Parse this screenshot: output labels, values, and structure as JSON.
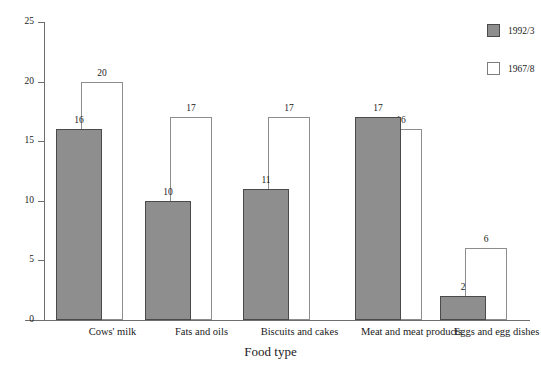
{
  "chart_data": {
    "type": "bar",
    "title": "",
    "xlabel": "Food type",
    "ylabel": "Percentage",
    "ylim": [
      0,
      25
    ],
    "yticks": [
      0,
      5,
      10,
      15,
      20,
      25
    ],
    "grid": false,
    "legend_position": "top-right",
    "categories": [
      "Cows' milk",
      "Fats and oils",
      "Biscuits and cakes",
      "Meat and meat products",
      "Eggs and egg dishes"
    ],
    "series": [
      {
        "name": "1992/3",
        "color": "#8e8e8e",
        "style": "filled",
        "values": [
          16,
          10,
          11,
          17,
          2
        ]
      },
      {
        "name": "1967/8",
        "color": "#ffffff",
        "style": "outline",
        "values": [
          20,
          17,
          17,
          16,
          6
        ]
      }
    ]
  },
  "legend": {
    "items": [
      {
        "label": "1992/3",
        "swatch": "filled-square-icon"
      },
      {
        "label": "1967/8",
        "swatch": "open-square-icon"
      }
    ]
  },
  "axes": {
    "y_title": "Percentage",
    "x_title": "Food type",
    "y_tick_labels": [
      "0",
      "5",
      "10",
      "15",
      "20",
      "25"
    ]
  }
}
